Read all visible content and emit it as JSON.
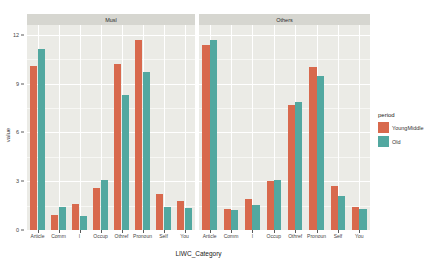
{
  "chart_data": {
    "type": "bar",
    "title": "",
    "xlabel": "LIWC_Category",
    "ylabel": "value",
    "ylim": [
      0,
      12.6
    ],
    "yticks": [
      0,
      3,
      6,
      9,
      12
    ],
    "ytick_labels": [
      "0",
      "3",
      "6",
      "9",
      "12"
    ],
    "grid": true,
    "legend_position": "right",
    "legend_title": "period",
    "categories": [
      "Article",
      "Comm",
      "I",
      "Occup",
      "Othref",
      "Pronoun",
      "Self",
      "You"
    ],
    "facets": [
      {
        "name": "Musl",
        "series": [
          {
            "name": "YoungMiddle",
            "color": "#d8694d",
            "values": [
              10.1,
              0.9,
              1.6,
              2.6,
              10.2,
              11.7,
              2.2,
              1.8
            ]
          },
          {
            "name": "Old",
            "color": "#52a8a0",
            "values": [
              11.1,
              1.4,
              0.85,
              3.1,
              8.3,
              9.7,
              1.4,
              1.35
            ]
          }
        ]
      },
      {
        "name": "Others",
        "series": [
          {
            "name": "YoungMiddle",
            "color": "#d8694d",
            "values": [
              11.4,
              1.3,
              1.9,
              3.0,
              7.7,
              10.0,
              2.7,
              1.4
            ]
          },
          {
            "name": "Old",
            "color": "#52a8a0",
            "values": [
              11.7,
              1.25,
              1.55,
              3.1,
              7.85,
              9.45,
              2.1,
              1.3
            ]
          }
        ]
      }
    ],
    "legend_entries": [
      {
        "label": "YoungMiddle",
        "color": "#d8694d"
      },
      {
        "label": "Old",
        "color": "#52a8a0"
      }
    ],
    "colors": {
      "series_young_middle": "#d8694d",
      "series_old": "#52a8a0",
      "panel_background": "#ebebe6",
      "strip_background": "#d6d6d0",
      "gridline": "#ffffff"
    }
  }
}
